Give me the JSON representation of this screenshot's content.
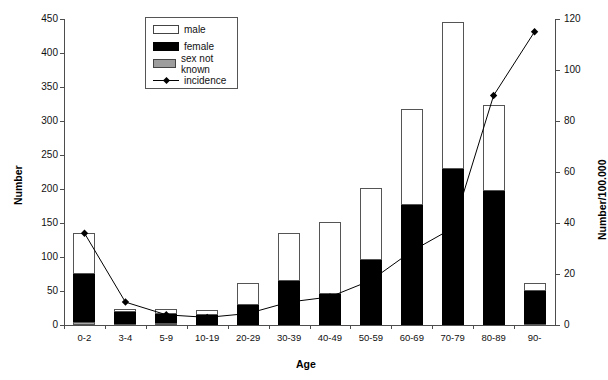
{
  "chart_data": {
    "type": "bar",
    "title": "",
    "xlabel": "Age",
    "ylabel": "Number",
    "y2label": "Number/100.000",
    "categories": [
      "0-2",
      "3-4",
      "5-9",
      "10-19",
      "20-29",
      "30-39",
      "40-49",
      "50-59",
      "60-69",
      "70-79",
      "80-89",
      "90-"
    ],
    "ylim": [
      0,
      450
    ],
    "yticks": [
      0,
      50,
      100,
      150,
      200,
      250,
      300,
      350,
      400,
      450
    ],
    "y2lim": [
      0,
      120
    ],
    "y2ticks": [
      0,
      20,
      40,
      60,
      80,
      100,
      120
    ],
    "grid": false,
    "legend_position": "top-center",
    "series": [
      {
        "name": "female",
        "type": "bar-segment",
        "color": "#000000",
        "values": [
          71,
          17,
          13,
          14,
          29,
          64,
          46,
          95,
          176,
          230,
          197,
          48
        ]
      },
      {
        "name": "male",
        "type": "bar-segment",
        "color": "#ffffff",
        "values": [
          61,
          5,
          8,
          8,
          33,
          72,
          105,
          106,
          141,
          215,
          126,
          12
        ]
      },
      {
        "name": "sex not known",
        "type": "bar-segment",
        "color": "#a8a8a8",
        "values": [
          4,
          2,
          3,
          0,
          0,
          0,
          0,
          0,
          0,
          0,
          0,
          2
        ]
      },
      {
        "name": "total",
        "type": "bar-total",
        "values": [
          136,
          24,
          24,
          22,
          62,
          136,
          151,
          201,
          317,
          445,
          323,
          62
        ]
      },
      {
        "name": "incidence",
        "type": "line",
        "axis": "right",
        "color": "#000000",
        "values": [
          36,
          9,
          4,
          3,
          4.5,
          9,
          11,
          17.5,
          29,
          38,
          90,
          115
        ]
      }
    ]
  },
  "legend": {
    "items": [
      {
        "label": "male",
        "swatch": "male"
      },
      {
        "label": "female",
        "swatch": "female"
      },
      {
        "label": "sex not known",
        "swatch": "unknown"
      },
      {
        "label": "incidence",
        "swatch": "line"
      }
    ]
  },
  "axes": {
    "left_title": "Number",
    "right_title": "Number/100.000",
    "x_title": "Age",
    "left_ticks": [
      "450",
      "400",
      "350",
      "300",
      "250",
      "200",
      "150",
      "100",
      "50",
      "0"
    ],
    "right_ticks": [
      "120",
      "100",
      "80",
      "60",
      "40",
      "20",
      "0"
    ]
  }
}
